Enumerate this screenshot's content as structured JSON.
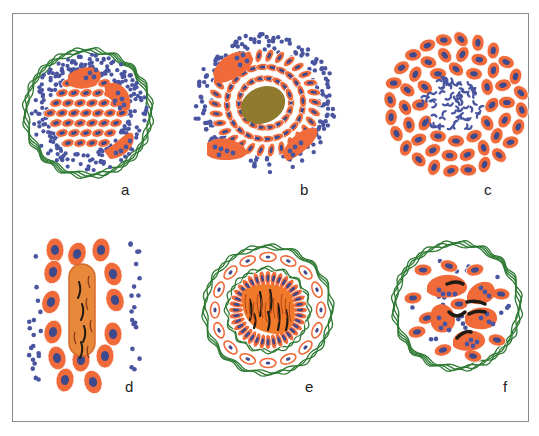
{
  "figure": {
    "panels": [
      {
        "id": "a",
        "label": "a",
        "description": "Encapsulated cluster: small blue round cells surrounding oval orange cells with large orange multinucleate cells, enclosed in green fibrous capsule"
      },
      {
        "id": "b",
        "label": "b",
        "description": "Radial arrangement of elongated orange cells around an olive-brown central mass, with crescent-shaped multinucleate cells, surrounded by blue round cells"
      },
      {
        "id": "c",
        "label": "c",
        "description": "Ring of orange cells with blue nuclei around a central cluster of blue curved fragments"
      },
      {
        "id": "d",
        "label": "d",
        "description": "Elongated orange cluster with central multinucleate cell containing dark striations, flanked by blue round cells"
      },
      {
        "id": "e",
        "label": "e",
        "description": "Central orange mass with dark striations surrounded by palisade of elongated cells and a green fibrous capsule containing flattened cells"
      },
      {
        "id": "f",
        "label": "f",
        "description": "Green-encapsulated cluster of orange cells, some multinucleate with black curved inclusions, among blue round cells"
      }
    ],
    "colors": {
      "cell_fill": "#f06a3a",
      "nucleus": "#3f4a8c",
      "lymphocyte": "#4a55a0",
      "capsule": "#2e7a33",
      "central_mass": "#8f7a2e",
      "striation": "#1e1a14",
      "frame": "#8a8a8a"
    }
  }
}
